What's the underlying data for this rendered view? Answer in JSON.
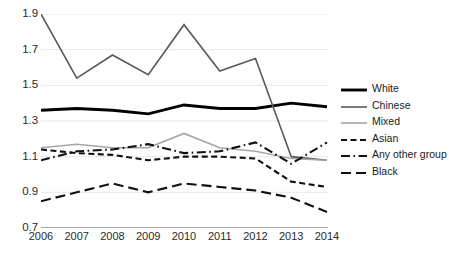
{
  "chart_data": {
    "type": "line",
    "title": "",
    "subtitle": "",
    "xlabel": "",
    "ylabel": "",
    "categories": [
      "2006",
      "2007",
      "2008",
      "2009",
      "2010",
      "2011",
      "2012",
      "2013",
      "2014"
    ],
    "x": [
      2006,
      2007,
      2008,
      2009,
      2010,
      2011,
      2012,
      2013,
      2014
    ],
    "ylim": [
      0.7,
      1.9
    ],
    "xlim": [
      2006,
      2014
    ],
    "yticks": [
      0.7,
      0.9,
      1.1,
      1.3,
      1.5,
      1.7,
      1.9
    ],
    "ytick_labels": [
      "0.7",
      "0.9",
      "1.1",
      "1.3",
      "1.5",
      "1.7",
      "1.9"
    ],
    "grid": "horizontal",
    "legend_position": "right",
    "series": [
      {
        "name": "White",
        "values": [
          1.36,
          1.37,
          1.36,
          1.34,
          1.39,
          1.37,
          1.37,
          1.4,
          1.38
        ],
        "color": "#000000",
        "style": "solid",
        "width": 2.9
      },
      {
        "name": "Chinese",
        "values": [
          1.9,
          1.54,
          1.67,
          1.56,
          1.84,
          1.58,
          1.65,
          1.1,
          1.08
        ],
        "color": "#595959",
        "style": "solid",
        "width": 1.6
      },
      {
        "name": "Mixed",
        "values": [
          1.15,
          1.17,
          1.15,
          1.15,
          1.23,
          1.15,
          1.13,
          1.09,
          1.08
        ],
        "color": "#a6a6a6",
        "style": "solid",
        "width": 1.6
      },
      {
        "name": "Asian",
        "values": [
          1.14,
          1.12,
          1.11,
          1.08,
          1.1,
          1.1,
          1.09,
          0.96,
          0.93
        ],
        "color": "#111111",
        "style": "dashed",
        "width": 2.1
      },
      {
        "name": "Any other group",
        "values": [
          1.08,
          1.13,
          1.14,
          1.17,
          1.12,
          1.13,
          1.18,
          1.06,
          1.18
        ],
        "color": "#111111",
        "style": "dashdot",
        "width": 2.1
      },
      {
        "name": "Black",
        "values": [
          0.85,
          0.9,
          0.95,
          0.9,
          0.95,
          0.93,
          0.91,
          0.87,
          0.79
        ],
        "color": "#111111",
        "style": "longdash",
        "width": 2.1
      }
    ]
  },
  "legend": {
    "items": [
      {
        "label": "White"
      },
      {
        "label": "Chinese"
      },
      {
        "label": "Mixed"
      },
      {
        "label": "Asian"
      },
      {
        "label": "Any other group"
      },
      {
        "label": "Black"
      }
    ]
  },
  "colors": {
    "axis": "#8c8c8c",
    "grid": "#e8e8e8",
    "text": "#2a2a2a",
    "white_series": "#000000",
    "chinese_series": "#595959",
    "mixed_series": "#a6a6a6",
    "dashed_series": "#111111"
  }
}
